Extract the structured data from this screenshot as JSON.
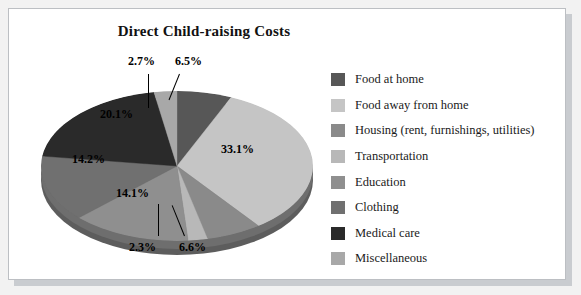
{
  "panel": {
    "background": "#ffffff",
    "border": "#bcbfc3",
    "shadow": "#c9ccd0"
  },
  "chart_data": {
    "type": "pie",
    "title": "Direct Child-raising Costs",
    "xlabel": "",
    "ylabel": "",
    "legend_position": "right",
    "grid": false,
    "three_d": true,
    "categories": [
      "Food at home",
      "Food away from home",
      "Housing (rent, furnishings, utilities)",
      "Transportation",
      "Education",
      "Clothing",
      "Medical care",
      "Miscellaneous"
    ],
    "values": [
      6.5,
      33.1,
      6.6,
      2.3,
      14.1,
      14.2,
      20.1,
      2.7
    ],
    "labels": [
      "6.5%",
      "33.1%",
      "6.6%",
      "2.3%",
      "14.1%",
      "14.2%",
      "20.1%",
      "2.7%"
    ],
    "colors": [
      "#575757",
      "#c5c5c5",
      "#8a8a8a",
      "#b8b8b8",
      "#8f8f8f",
      "#707070",
      "#2a2a2a",
      "#a8a8a8"
    ],
    "units": "percent"
  },
  "pie": {
    "label_0": "2.7%",
    "label_1": "6.5%",
    "label_2": "33.1%",
    "label_3": "6.6%",
    "label_4": "2.3%",
    "label_5": "14.1%",
    "label_6": "14.2%",
    "label_7": "20.1%"
  },
  "legend": {
    "items": [
      {
        "label": "Food at home",
        "color": "#575757"
      },
      {
        "label": "Food away from home",
        "color": "#c5c5c5"
      },
      {
        "label": "Housing (rent, furnishings, utilities)",
        "color": "#8a8a8a"
      },
      {
        "label": "Transportation",
        "color": "#b8b8b8"
      },
      {
        "label": "Education",
        "color": "#8f8f8f"
      },
      {
        "label": "Clothing",
        "color": "#707070"
      },
      {
        "label": "Medical care",
        "color": "#2a2a2a"
      },
      {
        "label": "Miscellaneous",
        "color": "#a8a8a8"
      }
    ]
  }
}
